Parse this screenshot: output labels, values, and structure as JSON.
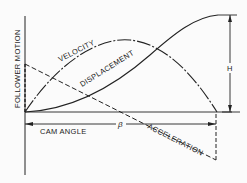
{
  "diagram": {
    "labels": {
      "y_axis": "FOLLOWER MOTION",
      "x_axis": "CAM ANGLE",
      "beta": "β",
      "height": "H",
      "velocity": "VELOCITY",
      "displacement": "DISPLACEMENT",
      "acceleration": "ACCELERATION"
    },
    "colors": {
      "line": "#222222",
      "background": "#fbfbfb"
    }
  }
}
